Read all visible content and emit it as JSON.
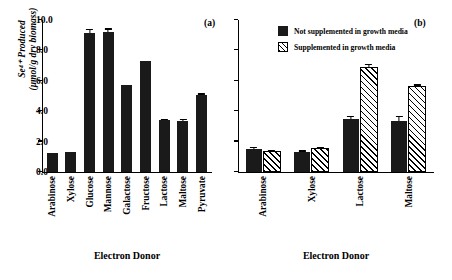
{
  "axis": {
    "ylabel_line1": "Se⁴⁺ Produced",
    "ylabel_line2": "(μmol/g dry biomass)",
    "xlabel": "Electron Donor",
    "ticks": [
      "0.0",
      "2.0",
      "4.0",
      "6.0",
      "8.0",
      "10.0"
    ]
  },
  "panels": {
    "a": {
      "tag": "(a)",
      "xlabel": "Electron Donor"
    },
    "b": {
      "tag": "(b)",
      "xlabel": "Electron Donor"
    }
  },
  "legend": {
    "items": [
      {
        "label": "Not supplemented in growth media",
        "swatch": "solid-black-square"
      },
      {
        "label": "Supplemented in growth media",
        "swatch": "hatched-square"
      }
    ]
  },
  "chart_data": [
    {
      "type": "bar",
      "title": "(a)",
      "xlabel": "Electron Donor",
      "ylabel": "Se4+ Produced (umol/g dry biomass)",
      "ylim": [
        0.0,
        10.0
      ],
      "ytick_step": 2.0,
      "grid": false,
      "legend": "none",
      "categories": [
        "Arabinose",
        "Xylose",
        "Glucose",
        "Mannose",
        "Galactose",
        "Fructose",
        "Lactose",
        "Maltose",
        "Pyruvate"
      ],
      "values": [
        1.25,
        1.3,
        9.15,
        9.2,
        5.7,
        7.3,
        3.4,
        3.35,
        5.05
      ],
      "errors": [
        0.0,
        0.0,
        0.25,
        0.25,
        0.0,
        0.0,
        0.12,
        0.12,
        0.12
      ]
    },
    {
      "type": "bar",
      "title": "(b)",
      "xlabel": "Electron Donor",
      "ylabel": "Se4+ Produced (umol/g dry biomass)",
      "ylim": [
        0.0,
        10.0
      ],
      "ytick_step": 2.0,
      "grid": false,
      "legend": "top-left",
      "categories": [
        "Arabinose",
        "Xylose",
        "Lactose",
        "Maltose"
      ],
      "series": [
        {
          "name": "Not supplemented in growth media",
          "values": [
            1.5,
            1.3,
            3.5,
            3.35
          ],
          "errors": [
            0.15,
            0.12,
            0.2,
            0.35
          ]
        },
        {
          "name": "Supplemented in growth media",
          "values": [
            1.25,
            1.45,
            6.8,
            5.5
          ],
          "errors": [
            0.12,
            0.15,
            0.25,
            0.2
          ]
        }
      ]
    }
  ]
}
